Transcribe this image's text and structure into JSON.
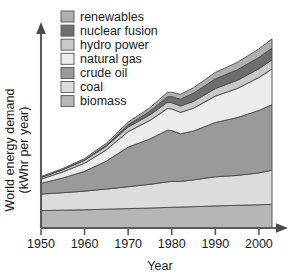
{
  "chart_data": {
    "type": "area",
    "title": "",
    "subtitle": "",
    "xlabel": "Year",
    "ylabel": "World energy demand (kWhr per year)",
    "ylabel_lines": [
      "World energy demand",
      "(kWhr per year)"
    ],
    "xlim": [
      1950,
      2003
    ],
    "ylim": [
      0,
      100
    ],
    "grid": false,
    "y_ticks_shown": false,
    "legend_position": "top-left-inside",
    "stacking_order_bottom_to_top": [
      "biomass",
      "coal",
      "crude oil",
      "natural gas",
      "hydro power",
      "nuclear fusion",
      "renewables"
    ],
    "xtick_labels": [
      "1950",
      "1960",
      "1970",
      "1980",
      "1990",
      "2000"
    ],
    "xticks": [
      1950,
      1960,
      1970,
      1980,
      1990,
      2000
    ],
    "x": [
      1950,
      1955,
      1960,
      1965,
      1970,
      1975,
      1979,
      1980,
      1982,
      1985,
      1990,
      1995,
      2000,
      2003
    ],
    "series": [
      {
        "name": "biomass",
        "color": "#b6b6b6",
        "values": [
          9.0,
          9.2,
          9.4,
          9.7,
          10.0,
          10.3,
          10.6,
          10.7,
          10.8,
          11.0,
          11.4,
          11.7,
          12.0,
          12.2
        ]
      },
      {
        "name": "coal",
        "color": "#dcdcdc",
        "values": [
          8.5,
          9.0,
          9.6,
          10.4,
          11.3,
          12.2,
          13.2,
          13.3,
          13.2,
          13.8,
          15.0,
          15.4,
          16.4,
          17.6
        ]
      },
      {
        "name": "crude oil",
        "color": "#9a9a9a",
        "values": [
          5.5,
          7.6,
          10.2,
          14.4,
          20.4,
          23.4,
          26.6,
          26.2,
          24.6,
          25.2,
          28.0,
          29.8,
          32.2,
          33.8
        ]
      },
      {
        "name": "natural gas",
        "color": "#ececec",
        "values": [
          2.2,
          3.1,
          4.2,
          5.8,
          8.0,
          9.6,
          11.2,
          11.2,
          11.0,
          11.8,
          13.6,
          15.0,
          17.0,
          18.4
        ]
      },
      {
        "name": "hydro power",
        "color": "#c9c9c9",
        "values": [
          0.9,
          1.2,
          1.5,
          1.9,
          2.4,
          2.8,
          3.2,
          3.2,
          3.3,
          3.5,
          3.9,
          4.2,
          4.5,
          4.7
        ]
      },
      {
        "name": "nuclear fusion",
        "color": "#6e6e6e",
        "values": [
          0.0,
          0.05,
          0.2,
          0.5,
          1.1,
          1.9,
          2.9,
          3.1,
          3.5,
          4.2,
          5.0,
          5.4,
          5.8,
          6.0
        ]
      },
      {
        "name": "renewables",
        "color": "#b0b0b0",
        "values": [
          0.4,
          0.5,
          0.7,
          1.0,
          1.4,
          1.8,
          2.2,
          2.3,
          2.5,
          2.8,
          3.3,
          3.8,
          4.4,
          4.8
        ]
      }
    ],
    "legend_entries": [
      {
        "label": "renewables",
        "color": "#b0b0b0"
      },
      {
        "label": "nuclear fusion",
        "color": "#6e6e6e"
      },
      {
        "label": "hydro power",
        "color": "#c9c9c9"
      },
      {
        "label": "natural gas",
        "color": "#ececec"
      },
      {
        "label": "crude oil",
        "color": "#9a9a9a"
      },
      {
        "label": "coal",
        "color": "#dcdcdc"
      },
      {
        "label": "biomass",
        "color": "#b6b6b6"
      }
    ]
  },
  "axes": {
    "x_title": "Year",
    "y_title_line1": "World energy demand",
    "y_title_line2": "(kWhr per year)"
  },
  "colors": {
    "background": "#ffffff",
    "axis": "#5a5a5a",
    "outline": "#4a4a4a",
    "text": "#1a1a1a"
  }
}
